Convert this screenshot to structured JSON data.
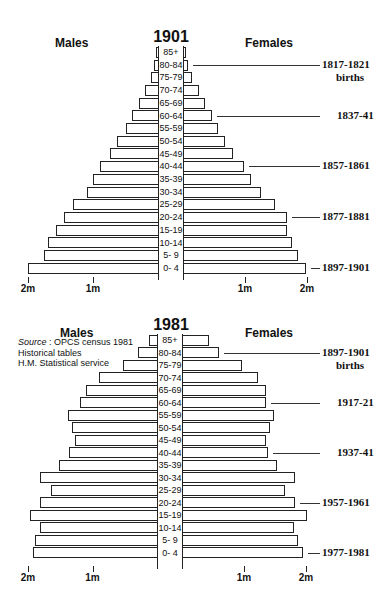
{
  "chart_data": [
    {
      "type": "bar",
      "subtype": "population-pyramid",
      "title": "1901",
      "left_label": "Males",
      "right_label": "Females",
      "unit": "millions",
      "categories": [
        "85+",
        "80-84",
        "75-79",
        "70-74",
        "65-69",
        "60-64",
        "55-59",
        "50-54",
        "45-49",
        "40-44",
        "35-39",
        "30-34",
        "25-29",
        "20-24",
        "15-19",
        "10-14",
        "5- 9",
        "0- 4"
      ],
      "series": [
        {
          "name": "Males",
          "values": [
            0.03,
            0.08,
            0.12,
            0.22,
            0.31,
            0.42,
            0.51,
            0.65,
            0.75,
            0.91,
            1.02,
            1.11,
            1.32,
            1.46,
            1.59,
            1.71,
            1.77,
            2.02
          ]
        },
        {
          "name": "Females",
          "values": [
            0.05,
            0.08,
            0.15,
            0.26,
            0.35,
            0.47,
            0.56,
            0.68,
            0.81,
            0.98,
            1.1,
            1.26,
            1.48,
            1.68,
            1.68,
            1.76,
            1.86,
            1.98
          ]
        }
      ],
      "x_ticks_left": [
        "2m",
        "1m"
      ],
      "x_ticks_right": [
        "1m",
        "2m"
      ],
      "xlim": [
        0,
        2
      ],
      "annotations": [
        {
          "age_group": "80-84",
          "text": "1817-1821",
          "subtext": "births"
        },
        {
          "age_group": "60-64",
          "text": "1837-41"
        },
        {
          "age_group": "40-44",
          "text": "1857-1861"
        },
        {
          "age_group": "20-24",
          "text": "1877-1881"
        },
        {
          "age_group": "0- 4",
          "text": "1897-1901"
        }
      ],
      "grid": false
    },
    {
      "type": "bar",
      "subtype": "population-pyramid",
      "title": "1981",
      "left_label": "Males",
      "right_label": "Females",
      "unit": "millions",
      "categories": [
        "85+",
        "80-84",
        "75-79",
        "70-74",
        "65-69",
        "60-64",
        "55-59",
        "50-54",
        "45-49",
        "40-44",
        "35-39",
        "30-34",
        "25-29",
        "20-24",
        "15-19",
        "10-14",
        "5- 9",
        "0- 4"
      ],
      "series": [
        {
          "name": "Males",
          "values": [
            0.14,
            0.31,
            0.54,
            0.91,
            1.12,
            1.21,
            1.4,
            1.33,
            1.29,
            1.38,
            1.53,
            1.83,
            1.66,
            1.83,
            1.98,
            1.83,
            1.91,
            1.94
          ]
        },
        {
          "name": "Females",
          "values": [
            0.44,
            0.6,
            0.97,
            1.23,
            1.36,
            1.36,
            1.48,
            1.42,
            1.36,
            1.39,
            1.53,
            1.82,
            1.66,
            1.82,
            2.02,
            1.81,
            1.87,
            1.95
          ]
        }
      ],
      "x_ticks_left": [
        "2m",
        "1m"
      ],
      "x_ticks_right": [
        "1m",
        "2m"
      ],
      "xlim": [
        0,
        2
      ],
      "annotations": [
        {
          "age_group": "80-84",
          "text": "1897-1901",
          "subtext": "births"
        },
        {
          "age_group": "60-64",
          "text": "1917-21"
        },
        {
          "age_group": "40-44",
          "text": "1937-41"
        },
        {
          "age_group": "20-24",
          "text": "1957-1961"
        },
        {
          "age_group": "0- 4",
          "text": "1977-1981"
        }
      ],
      "source": {
        "label": "Source",
        "line1": " : OPCS census 1981",
        "line2": "Historical tables",
        "line3": "H.M. Statistical service"
      },
      "grid": false
    }
  ]
}
